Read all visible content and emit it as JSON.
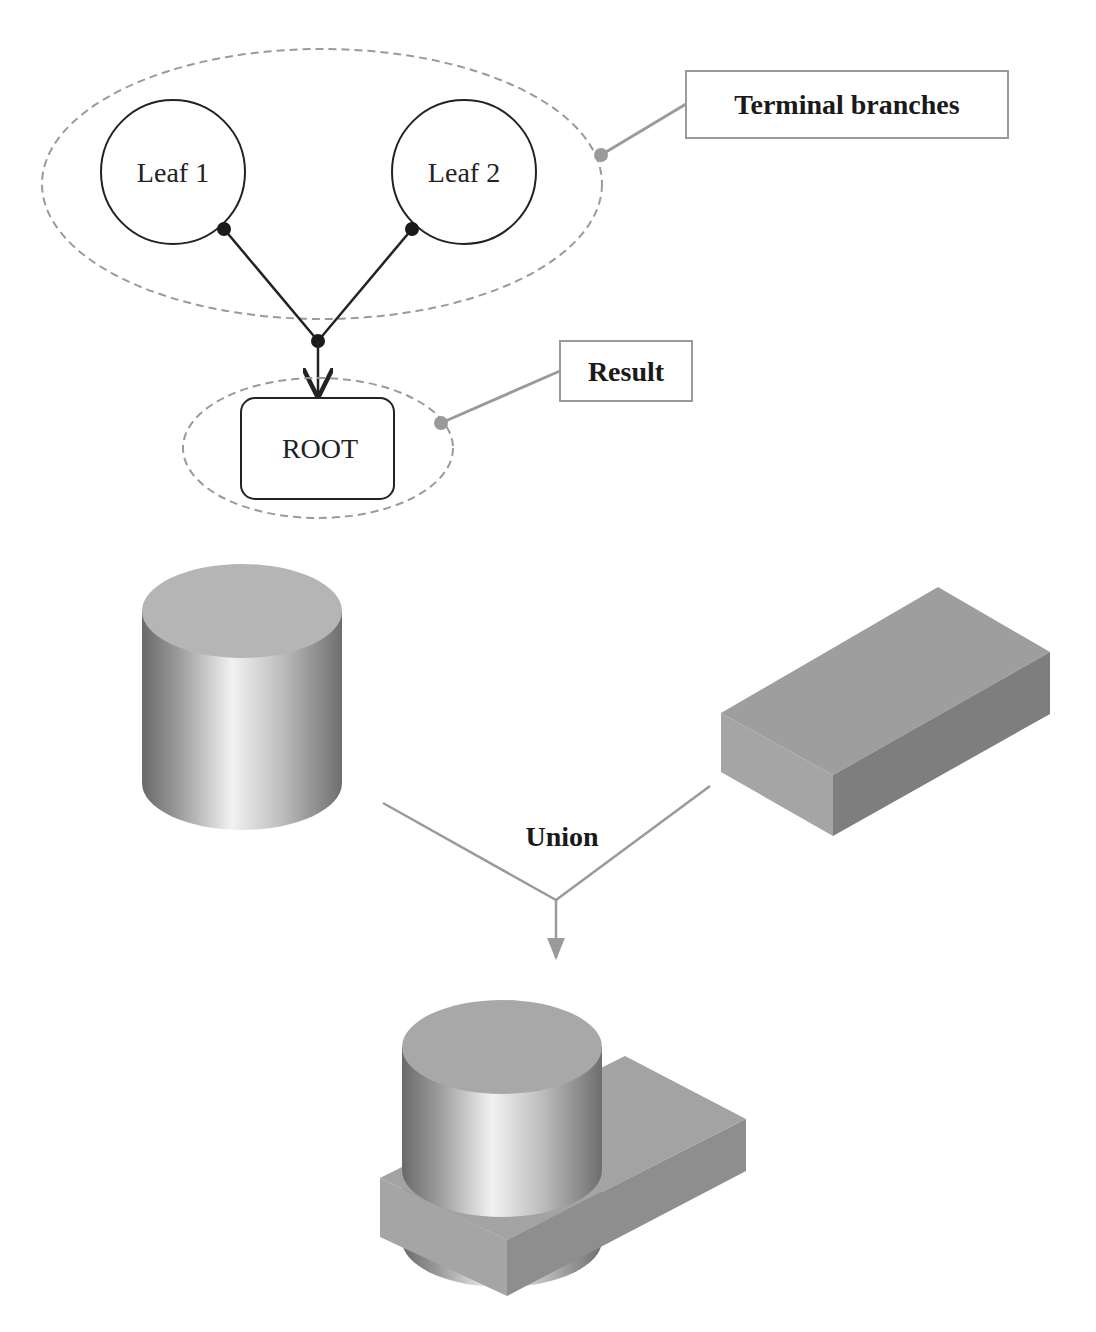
{
  "tree": {
    "leaves": [
      {
        "label": "Leaf 1"
      },
      {
        "label": "Leaf 2"
      }
    ],
    "root": {
      "label": "ROOT"
    },
    "callouts": {
      "terminal": "Terminal branches",
      "result": "Result"
    }
  },
  "operation": {
    "label": "Union"
  },
  "shapes": {
    "inputs": [
      "cylinder",
      "box"
    ],
    "output": "cylinder-box-union"
  },
  "colors": {
    "line": "#222222",
    "callout": "#9a9a9a",
    "dashed": "#9a9a9a",
    "solid_top": "#b3b3b3",
    "box_top": "#9e9e9e",
    "box_front": "#a3a3a3",
    "box_side": "#7c7c7c"
  }
}
